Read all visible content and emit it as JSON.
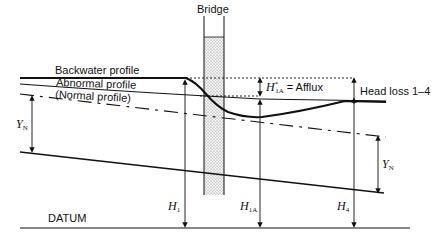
{
  "diagram": {
    "type": "bridge afflux / backwater schematic",
    "labels": {
      "bridge": "Bridge",
      "backwater_profile": "Backwater profile",
      "abnormal_profile": "Abnormal profile",
      "normal_profile": "(Normal profile)",
      "afflux_symbol": "H",
      "afflux_sup": "*",
      "afflux_sub": "1A",
      "afflux_text": "= Afflux",
      "head_loss": "Head loss 1–4",
      "yn_left": "Y",
      "yn_left_sub": "N",
      "yn_right": "Y",
      "yn_right_sub": "N",
      "h1": "H",
      "h1_sub": "1",
      "h1a": "H",
      "h1a_sub": "1A",
      "h4": "H",
      "h4_sub": "4",
      "datum": "DATUM"
    },
    "colors": {
      "line": "#111111",
      "stipple": "#888888",
      "background": "#ffffff"
    }
  }
}
